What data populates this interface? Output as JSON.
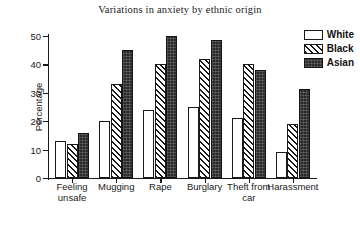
{
  "chart_data": {
    "type": "bar",
    "title": "Variations in anxiety by ethnic origin",
    "xlabel": "",
    "ylabel": "Percentage",
    "ylim": [
      0,
      50
    ],
    "yticks": [
      0,
      10,
      20,
      30,
      40,
      50
    ],
    "grid": false,
    "legend_position": "top-right",
    "categories": [
      "Feeling unsafe",
      "Mugging",
      "Rape",
      "Burglary",
      "Theft from car",
      "Harassment"
    ],
    "series": [
      {
        "name": "White",
        "fill": "empty",
        "values": [
          13,
          20,
          24,
          25,
          21,
          9
        ]
      },
      {
        "name": "Black",
        "fill": "hatch",
        "values": [
          12,
          33,
          40,
          42,
          40,
          19
        ]
      },
      {
        "name": "Asian",
        "fill": "solid",
        "values": [
          16,
          45,
          50,
          48.5,
          38,
          31.5
        ]
      }
    ]
  },
  "legend": {
    "items": [
      {
        "label": "White"
      },
      {
        "label": "Black"
      },
      {
        "label": "Asian"
      }
    ]
  },
  "colors": {
    "axis": "#1a1a1a",
    "white_series": "#ffffff",
    "black_series": "#1a1a1a",
    "asian_series": "#2b2b2b",
    "background": "#ffffff"
  }
}
